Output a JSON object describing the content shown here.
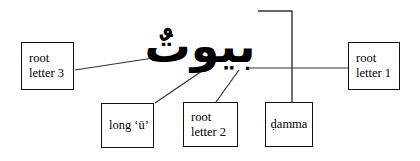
{
  "diagram": {
    "type": "annotated-word-diagram",
    "script": "Arabic",
    "word": "بيوتٌ",
    "word_transliteration": "buyūt",
    "background_color": "#ffffff",
    "line_color": "#333333",
    "box_border_color": "#111111",
    "text_color": "#000000",
    "callouts": [
      {
        "id": "root-letter-3",
        "lines": [
          "root",
          "letter 3"
        ],
        "box": {
          "x": 21,
          "y": 42,
          "w": 53,
          "h": 48
        },
        "align": "left"
      },
      {
        "id": "root-letter-1",
        "lines": [
          "root",
          "letter 1"
        ],
        "box": {
          "x": 348,
          "y": 42,
          "w": 52,
          "h": 48
        },
        "align": "left"
      },
      {
        "id": "long-u",
        "lines": [
          "long ‘ū’"
        ],
        "box": {
          "x": 101,
          "y": 103,
          "w": 53,
          "h": 45
        },
        "align": "left"
      },
      {
        "id": "root-letter-2",
        "lines": [
          "root",
          "letter 2"
        ],
        "box": {
          "x": 183,
          "y": 102,
          "w": 55,
          "h": 45
        },
        "align": "left"
      },
      {
        "id": "damma",
        "lines": [
          "ḍamma"
        ],
        "box": {
          "x": 265,
          "y": 102,
          "w": 48,
          "h": 45
        },
        "align": "center"
      }
    ],
    "connectors": [
      {
        "id": "connector-root-letter-3",
        "points": "75,70 160,57"
      },
      {
        "id": "connector-root-letter-1",
        "points": "250,68 348,68"
      },
      {
        "id": "connector-long-u",
        "points": "155,103 202,71"
      },
      {
        "id": "connector-root-letter-2",
        "points": "216,102 239,70"
      },
      {
        "id": "connector-damma",
        "points": "258,11 292,11 292,102"
      }
    ]
  }
}
